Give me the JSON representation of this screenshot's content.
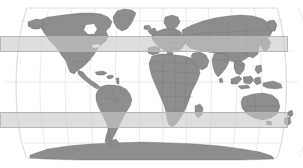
{
  "figure": {
    "type": "world-map",
    "projection": "Robinson",
    "width": 303,
    "height": 168,
    "background_color": "#ffffff",
    "title": "",
    "caption": ""
  },
  "map_style": {
    "land_fill": "#8d8d8d",
    "land_stroke": "#666666",
    "country_border_color": "#6e6e6e",
    "graticule_color": "#e2e2e2",
    "outline_color": "#d8d8d8",
    "ocean_fill": "#ffffff"
  },
  "graticule": {
    "visible": true,
    "parallel_interval_deg": 30,
    "meridian_interval_deg": 30,
    "parallels_deg": [
      -60,
      -30,
      0,
      30,
      60
    ],
    "meridians_deg": [
      -180,
      -150,
      -120,
      -90,
      -60,
      -30,
      0,
      30,
      60,
      90,
      120,
      150,
      180
    ]
  },
  "highlight_bands": [
    {
      "name": "northern-latitude-band",
      "fill": "#c9c9c9",
      "opacity": 0.62,
      "stroke": "#b4b4b4",
      "x": 0,
      "y": 36,
      "width": 288,
      "height": 16
    },
    {
      "name": "southern-latitude-band",
      "fill": "#c9c9c9",
      "opacity": 0.62,
      "stroke": "#b4b4b4",
      "x": 0,
      "y": 112,
      "width": 288,
      "height": 16
    }
  ],
  "landmasses": [
    {
      "name": "greenland",
      "label": "Greenland"
    },
    {
      "name": "north-america",
      "label": "North America"
    },
    {
      "name": "central-america",
      "label": "Central America"
    },
    {
      "name": "caribbean",
      "label": "Caribbean"
    },
    {
      "name": "south-america",
      "label": "South America"
    },
    {
      "name": "europe",
      "label": "Europe"
    },
    {
      "name": "africa",
      "label": "Africa"
    },
    {
      "name": "madagascar",
      "label": "Madagascar"
    },
    {
      "name": "asia",
      "label": "Asia"
    },
    {
      "name": "arabia",
      "label": "Arabian Peninsula"
    },
    {
      "name": "india",
      "label": "India"
    },
    {
      "name": "japan",
      "label": "Japan"
    },
    {
      "name": "indonesia",
      "label": "Indonesian Archipelago"
    },
    {
      "name": "australia",
      "label": "Australia"
    },
    {
      "name": "new-zealand",
      "label": "New Zealand"
    },
    {
      "name": "antarctica",
      "label": "Antarctica"
    },
    {
      "name": "iceland",
      "label": "Iceland"
    },
    {
      "name": "british-isles",
      "label": "British Isles"
    }
  ],
  "chart_data": {
    "type": "map",
    "title": "",
    "xlabel": "Longitude",
    "ylabel": "Latitude",
    "xlim": [
      -180,
      180
    ],
    "ylim": [
      -90,
      90
    ],
    "grid": true,
    "legend": null,
    "annotations": [
      {
        "kind": "horizontal-band",
        "label": "northern-latitude-band",
        "lat_range": [
          17,
          36
        ]
      },
      {
        "kind": "horizontal-band",
        "label": "southern-latitude-band",
        "lat_range": [
          -40,
          -22
        ]
      }
    ]
  }
}
